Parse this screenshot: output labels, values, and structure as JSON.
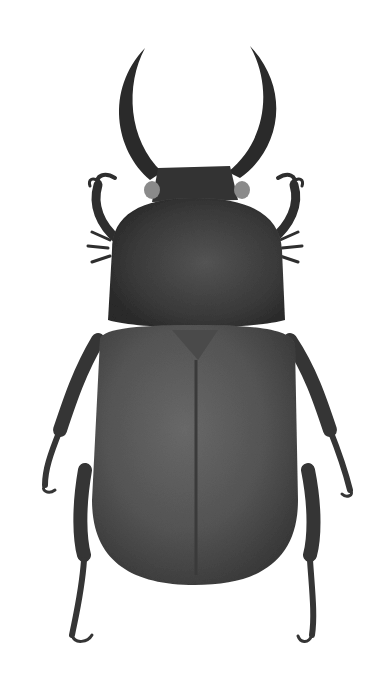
{
  "image": {
    "subject": "beetle",
    "description": "Grayscale illustration of a horned scarab beetle (dorsal view) on white background",
    "background_color": "#ffffff",
    "body_color": "#3a3a3a",
    "elytra_color": "#555555",
    "pronotum_color": "#3c3c3c",
    "horn_color": "#2a2a2a",
    "leg_color": "#333333"
  }
}
